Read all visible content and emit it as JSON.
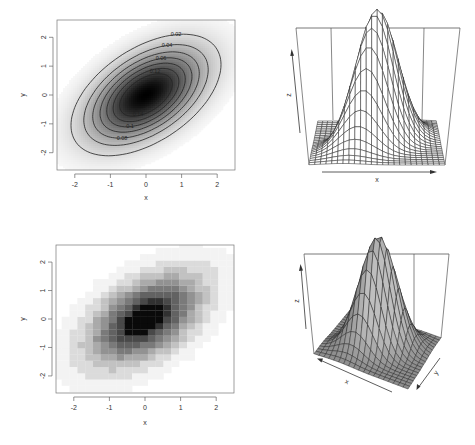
{
  "figure": {
    "layout": "2x2 panel grid",
    "panels": [
      "filled-contour",
      "wireframe-perspective",
      "image-heatmap",
      "shaded-perspective"
    ]
  },
  "chart_data": [
    {
      "type": "contour",
      "panel": "top-left",
      "title": "",
      "xlabel": "x",
      "ylabel": "y",
      "xlim": [
        -2.5,
        2.5
      ],
      "ylim": [
        -2.6,
        2.6
      ],
      "x_ticks": [
        -2,
        -1,
        0,
        1,
        2
      ],
      "y_ticks": [
        -2,
        -1,
        0,
        1,
        2
      ],
      "x_tick_labels": [
        "-2",
        "-1",
        "0",
        "1",
        "2"
      ],
      "y_tick_labels": [
        "-2",
        "-1",
        "0",
        "1",
        "2"
      ],
      "distribution": "bivariate normal",
      "mean": [
        0,
        0
      ],
      "sd": [
        1,
        1
      ],
      "rho": 0.5,
      "levels": [
        0.02,
        0.04,
        0.06,
        0.08,
        0.1,
        0.12,
        0.14,
        0.16
      ],
      "visible_level_labels": [
        "0.02",
        "0.04",
        "0.06",
        "0.12",
        "0.14",
        "0.1",
        "0.08"
      ],
      "fill": "grayscale, darker = higher density",
      "grid": false
    },
    {
      "type": "surface-wireframe",
      "panel": "top-right",
      "xlabel": "x",
      "ylabel": "y",
      "zlabel": "z",
      "view": {
        "theta": 0,
        "phi": 15
      },
      "grid_lines": 25,
      "distribution": "bivariate normal",
      "rho": 0.5,
      "zmax": 0.18
    },
    {
      "type": "heatmap",
      "panel": "bottom-left",
      "xlabel": "x",
      "ylabel": "y",
      "xlim": [
        -2.5,
        2.5
      ],
      "ylim": [
        -2.6,
        2.6
      ],
      "x_ticks": [
        -2,
        -1,
        0,
        1,
        2
      ],
      "y_ticks": [
        -2,
        -1,
        0,
        1,
        2
      ],
      "x_tick_labels": [
        "-2",
        "-1",
        "0",
        "1",
        "2"
      ],
      "y_tick_labels": [
        "-2",
        "-1",
        "0",
        "1",
        "2"
      ],
      "cell_size": 0.22,
      "distribution": "bivariate normal",
      "rho": 0.5,
      "colormap": "white-to-black grayscale"
    },
    {
      "type": "surface-shaded",
      "panel": "bottom-right",
      "xlabel": "x",
      "ylabel": "y",
      "zlabel": "z",
      "view": {
        "theta": 30,
        "phi": 20
      },
      "grid_lines": 20,
      "distribution": "bivariate normal",
      "rho": 0.5,
      "shade": "gray"
    }
  ],
  "labels": {
    "p1_x": "x",
    "p1_y": "y",
    "p2_x": "x",
    "p2_z": "z",
    "p3_x": "x",
    "p3_y": "y",
    "p4_x": "x",
    "p4_y": "y",
    "p4_z": "z"
  },
  "colors": {
    "axis": "#555555",
    "contour_line": "#222222",
    "mesh_line": "#222222",
    "surface_fill": "#bdbdbd"
  }
}
